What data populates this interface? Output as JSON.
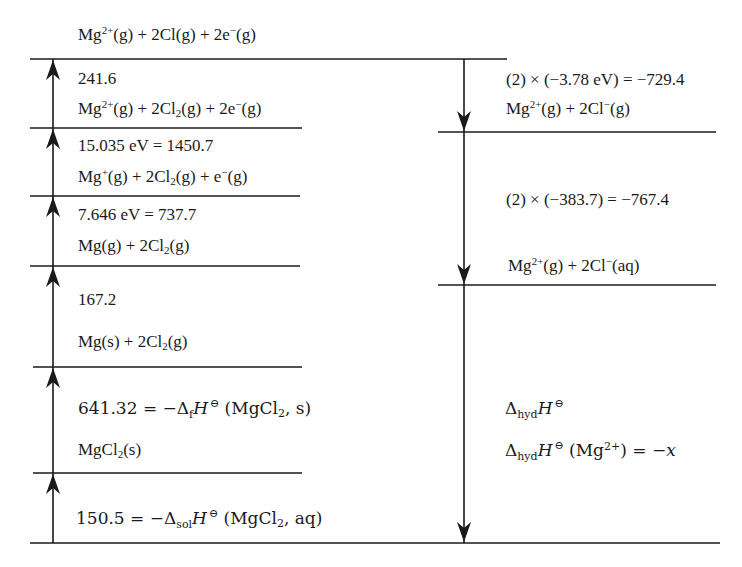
{
  "diagram": {
    "type": "Born-Haber cycle (energy level diagram)",
    "colors": {
      "line": "#1a1a1a",
      "background": "#ffffff"
    },
    "left_column": {
      "levels": [
        {
          "id": "L0",
          "species": "Mg²⁺(g) + 2Cl(g) + 2e⁻(g)"
        },
        {
          "id": "L1",
          "step_value": "241.6",
          "species": "Mg²⁺(g) + 2Cl₂(g) + 2e⁻(g)"
        },
        {
          "id": "L2",
          "step_value": "15.035 eV = 1450.7",
          "species": "Mg⁺(g) + 2Cl₂(g) + e⁻(g)"
        },
        {
          "id": "L3",
          "step_value": "7.646 eV = 737.7",
          "species": "Mg(g) + 2Cl₂(g)"
        },
        {
          "id": "L4",
          "step_value": "167.2",
          "species": "Mg(s) + 2Cl₂(g)"
        },
        {
          "id": "L5",
          "step_value": "641.32 = −ΔfH⊖ (MgCl₂, s)",
          "species": "MgCl₂(s)"
        },
        {
          "id": "L6",
          "step_value": "150.5 = −ΔsolH⊖ (MgCl₂, aq)"
        }
      ],
      "arrow_direction": "up"
    },
    "right_column": {
      "steps": [
        {
          "step_value": "(2) × (−3.78 eV) = −729.4",
          "species": "Mg²⁺(g) + 2Cl⁻(g)"
        },
        {
          "step_value": "(2) × (−383.7) = −767.4",
          "species": "Mg²⁺(g) + 2Cl⁻(aq)"
        },
        {
          "step_value": "ΔhydH⊖",
          "note": "ΔhydH⊖ (Mg²⁺) = −x"
        }
      ],
      "arrow_direction": "down"
    }
  },
  "labels": {
    "top": {
      "a": "Mg",
      "sup": "2+",
      "b": "(g) + 2Cl(g) + 2e",
      "sup2": "−",
      "c": "(g)"
    },
    "l1_value": "241.6",
    "l1_species": {
      "a": "Mg",
      "sup": "2+",
      "b": "(g) + 2Cl",
      "sub": "2",
      "c": "(g) + 2e",
      "sup2": "−",
      "d": "(g)"
    },
    "l2_value": "15.035 eV = 1450.7",
    "l2_species": {
      "a": "Mg",
      "sup": "+",
      "b": "(g) + 2Cl",
      "sub": "2",
      "c": "(g) + e",
      "sup2": "−",
      "d": "(g)"
    },
    "l3_value": "7.646 eV = 737.7",
    "l3_species": {
      "a": "Mg(g) + 2Cl",
      "sub": "2",
      "b": "(g)"
    },
    "l4_value": "167.2",
    "l4_species": {
      "a": "Mg(s) + 2Cl",
      "sub": "2",
      "b": "(g)"
    },
    "l5_value": {
      "a": "641.32 = −Δ",
      "sub": "f",
      "H": "H",
      "theta": "⊖",
      "b": " (MgCl",
      "sub2": "2",
      "c": ", s)"
    },
    "l5_species": {
      "a": "MgCl",
      "sub": "2",
      "b": "(s)"
    },
    "l6_value": {
      "a": "150.5 = −Δ",
      "sub": "sol",
      "H": "H",
      "theta": "⊖",
      "b": " (MgCl",
      "sub2": "2",
      "c": ", aq)"
    },
    "r1_value": "(2) × (−3.78 eV) = −729.4",
    "r1_species": {
      "a": "Mg",
      "sup": "2+",
      "b": "(g) + 2Cl",
      "sup2": "−",
      "c": "(g)"
    },
    "r2_value": "(2) × (−383.7) = −767.4",
    "r2_species": {
      "a": "Mg",
      "sup": "2+",
      "b": "(g) + 2Cl",
      "sup2": "−",
      "c": "(aq)"
    },
    "r3_value": {
      "a": "Δ",
      "sub": "hyd",
      "H": "H",
      "theta": "⊖"
    },
    "r3_note": {
      "a": "Δ",
      "sub": "hyd",
      "H": "H",
      "theta": "⊖",
      "b": " (Mg",
      "sup": "2+",
      "c": ") = −",
      "x": "x"
    }
  }
}
